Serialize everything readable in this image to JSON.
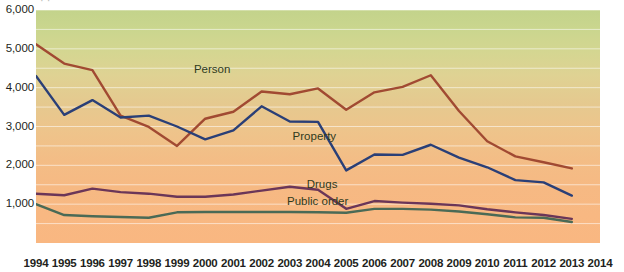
{
  "chart_data": {
    "type": "line",
    "title": "",
    "xlabel": "",
    "ylabel": "",
    "x": [
      1994,
      1995,
      1996,
      1997,
      1998,
      1999,
      2000,
      2001,
      2002,
      2003,
      2004,
      2005,
      2006,
      2007,
      2008,
      2009,
      2010,
      2011,
      2012,
      2013
    ],
    "xlim": [
      1994,
      2014
    ],
    "ylim": [
      0,
      6000
    ],
    "y_ticks": [
      1000,
      2000,
      3000,
      4000,
      5000,
      6000
    ],
    "y_tick_labels": [
      "1,000",
      "2,000",
      "3,000",
      "4,000",
      "5,000",
      "6,000"
    ],
    "x_tick_labels": [
      "1994",
      "1995",
      "1996",
      "1997",
      "1998",
      "1999",
      "2000",
      "2001",
      "2002",
      "2003",
      "2004",
      "2005",
      "2006",
      "2007",
      "2008",
      "2009",
      "2010",
      "2011",
      "2012",
      "2013",
      "2014"
    ],
    "grid": true,
    "grid_step": 500,
    "legend": "inline-labels",
    "series": [
      {
        "name": "Person",
        "color": "#a14a32",
        "label_x": 1999.6,
        "label_y": 4420,
        "values": [
          5120,
          4620,
          4450,
          3280,
          2990,
          2500,
          3200,
          3380,
          3900,
          3830,
          3980,
          3430,
          3880,
          4020,
          4320,
          3400,
          2620,
          2230,
          2080,
          1920
        ]
      },
      {
        "name": "Property",
        "color": "#2a3f77",
        "label_x": 2003.1,
        "label_y": 2700,
        "values": [
          4300,
          3300,
          3680,
          3230,
          3280,
          3000,
          2670,
          2900,
          3520,
          3130,
          3120,
          1870,
          2280,
          2270,
          2530,
          2200,
          1950,
          1620,
          1560,
          1220
        ]
      },
      {
        "name": "Drugs",
        "color": "#6b3658",
        "label_x": 2003.6,
        "label_y": 1470,
        "values": [
          1270,
          1230,
          1400,
          1310,
          1270,
          1190,
          1190,
          1250,
          1350,
          1450,
          1370,
          880,
          1080,
          1040,
          1010,
          970,
          870,
          790,
          720,
          620
        ]
      },
      {
        "name": "Public order",
        "color": "#4a6a56",
        "label_x": 2002.9,
        "label_y": 1030,
        "values": [
          1000,
          720,
          690,
          670,
          650,
          790,
          800,
          800,
          800,
          800,
          790,
          780,
          880,
          880,
          860,
          810,
          740,
          660,
          650,
          540
        ]
      }
    ]
  },
  "top_cropped_text": "·  ·"
}
